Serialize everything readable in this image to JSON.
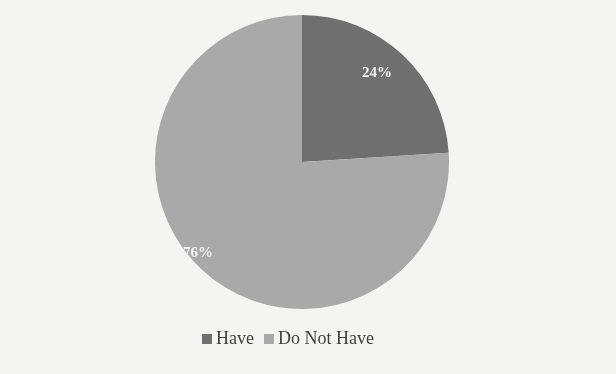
{
  "chart_data": {
    "type": "pie",
    "title": "",
    "categories": [
      "Have",
      "Do Not Have"
    ],
    "values": [
      24,
      76
    ],
    "labels": [
      "24%",
      "76%"
    ],
    "colors": [
      "#6f6f6f",
      "#a9a9a9"
    ],
    "start_angle_deg": 0,
    "direction": "clockwise",
    "legend_position": "bottom"
  },
  "legend": {
    "items": [
      {
        "label": "Have",
        "color": "#6f6f6f"
      },
      {
        "label": "Do Not Have",
        "color": "#a9a9a9"
      }
    ]
  }
}
